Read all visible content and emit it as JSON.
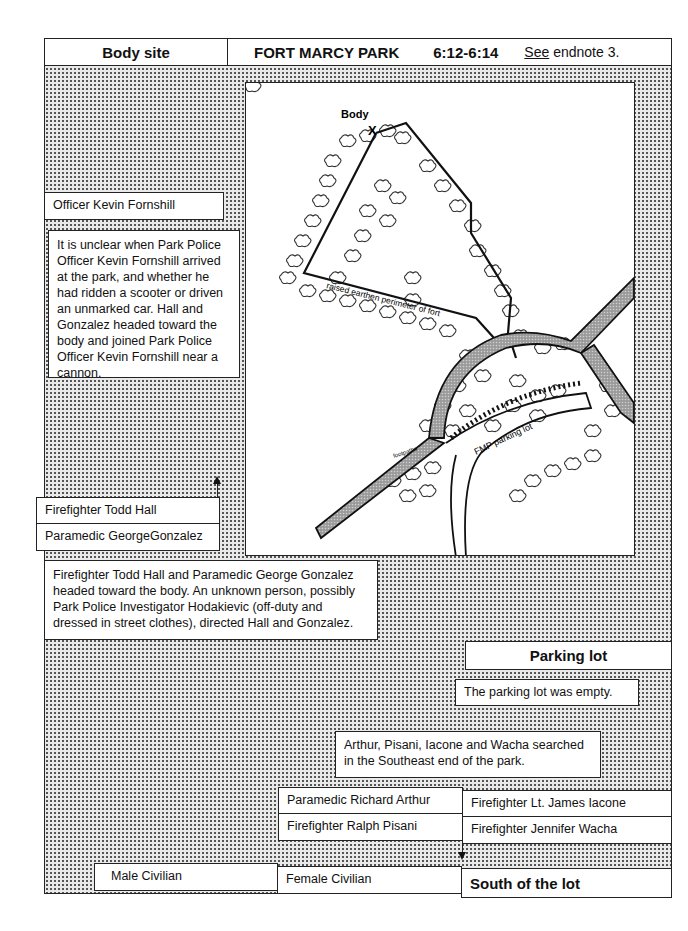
{
  "header": {
    "location_label": "Body site",
    "park_name": "FORT MARCY PARK",
    "time_range": "6:12-6:14",
    "note_see": "See",
    "note_rest": " endnote 3."
  },
  "map": {
    "body_label": "Body",
    "body_marker": "X",
    "perimeter_label": "raised earthen perimeter of fort",
    "parking_label": "FMP parking lot",
    "footpaths_label": "footpaths"
  },
  "people": {
    "fornshill": "Officer Kevin Fornshill",
    "hall": "Firefighter Todd Hall",
    "gonzalez": "Paramedic GeorgeGonzalez",
    "arthur": "Paramedic Richard Arthur",
    "iacone": "Firefighter Lt. James Iacone",
    "pisani": "Firefighter Ralph Pisani",
    "wacha": "Firefighter Jennifer Wacha",
    "male_civilian": "Male Civilian",
    "female_civilian": "Female Civilian"
  },
  "notes": {
    "fornshill": "It is unclear when Park Police Officer Kevin Fornshill arrived at the park, and whether he had ridden a scooter or driven an unmarked car.  Hall and Gonzalez headed toward the body and joined Park Police Officer Kevin Fornshill near a cannon.",
    "hall_gonzalez": "Firefighter Todd Hall and Paramedic George Gonzalez headed toward the body.  An unknown person, possibly Park Police Investigator Hodakievic (off-duty and dressed in street clothes), directed Hall and Gonzalez.",
    "parking_empty": "The parking lot was empty.",
    "search": "Arthur, Pisani, Iacone and Wacha searched in the Southeast end of the park."
  },
  "sections": {
    "parking_lot": "Parking lot",
    "south_of_lot": "South of the lot"
  }
}
